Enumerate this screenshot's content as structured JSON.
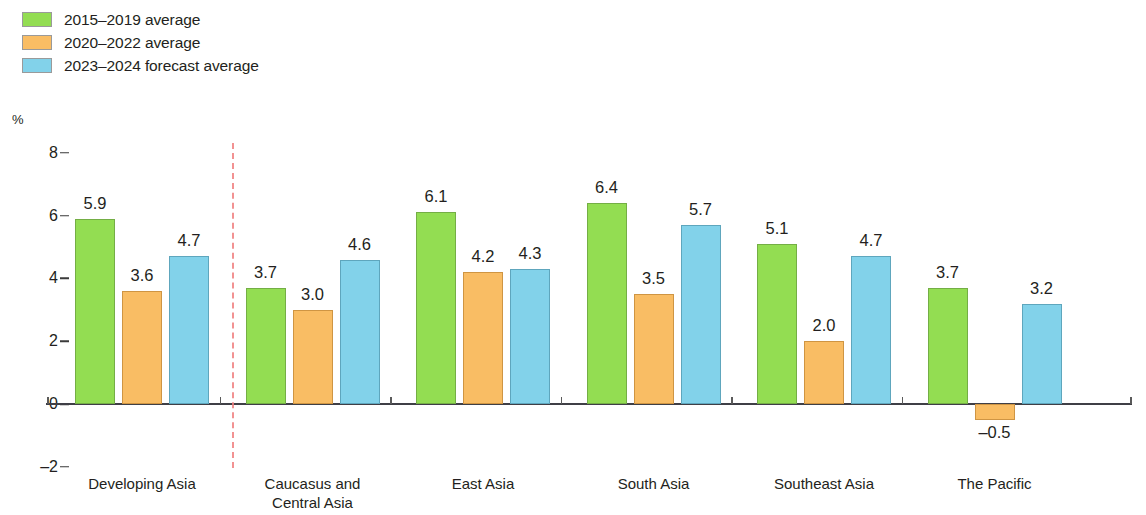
{
  "chart_data": {
    "type": "bar",
    "title": "",
    "subtitle": "",
    "xlabel": "",
    "ylabel": "%",
    "ylim": [
      -2,
      8
    ],
    "yticks": [
      8,
      6,
      4,
      2,
      0,
      -2
    ],
    "ytick_labels": [
      "8",
      "6",
      "4",
      "2",
      "0",
      "–2"
    ],
    "grid": false,
    "legend_position": "top-left",
    "categories": [
      "Developing Asia",
      "Caucasus and\nCentral Asia",
      "East Asia",
      "South Asia",
      "Southeast Asia",
      "The Pacific"
    ],
    "series": [
      {
        "name": "2015–2019 average",
        "color": "#93dd52",
        "values": [
          5.9,
          3.7,
          6.1,
          6.4,
          5.1,
          3.7
        ],
        "value_labels": [
          "5.9",
          "3.7",
          "6.1",
          "6.4",
          "5.1",
          "3.7"
        ]
      },
      {
        "name": "2020–2022 average",
        "color": "#f9bd64",
        "values": [
          3.6,
          3.0,
          4.2,
          3.5,
          2.0,
          -0.5
        ],
        "value_labels": [
          "3.6",
          "3.0",
          "4.2",
          "3.5",
          "2.0",
          "–0.5"
        ]
      },
      {
        "name": "2023–2024 forecast average",
        "color": "#82d2ea",
        "values": [
          4.7,
          4.6,
          4.3,
          5.7,
          4.7,
          3.2
        ],
        "value_labels": [
          "4.7",
          "4.6",
          "4.3",
          "5.7",
          "4.7",
          "3.2"
        ]
      }
    ],
    "annotations": [
      {
        "type": "vertical-dashed-separator",
        "after_category": "Developing Asia",
        "color": "#f08080"
      }
    ]
  },
  "legend": {
    "items": [
      {
        "label": "2015–2019 average",
        "color": "#93dd52"
      },
      {
        "label": "2020–2022 average",
        "color": "#f9bd64"
      },
      {
        "label": "2023–2024 forecast average",
        "color": "#82d2ea"
      }
    ]
  },
  "axis": {
    "unit": "%"
  }
}
